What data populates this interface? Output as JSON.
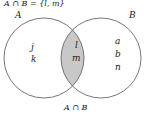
{
  "diagram": {
    "title": "A ∩ B = {l, m}",
    "set_a": {
      "label": "A",
      "elements": [
        "j",
        "k"
      ]
    },
    "set_b": {
      "label": "B",
      "elements": [
        "a",
        "b",
        "n"
      ]
    },
    "intersection": {
      "elements": [
        "l",
        "m"
      ],
      "fill": "#c8c8c8"
    },
    "caption": "A ∩ B"
  }
}
